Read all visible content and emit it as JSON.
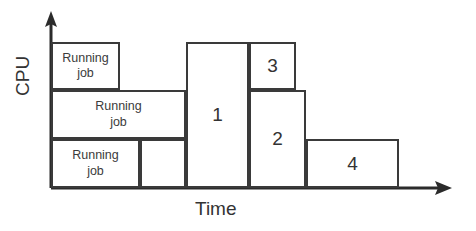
{
  "diagram": {
    "axes": {
      "y_label": "CPU",
      "x_label": "Time",
      "y_arrow": "up-arrow",
      "x_arrow": "right-arrow",
      "line_color": "#2b2b2b"
    },
    "style": {
      "block_border_color": "#3a3a3a",
      "block_fill": "#ffffff",
      "background": "#ffffff",
      "text_color": "#333333"
    },
    "blocks": [
      {
        "id": "running-job-top",
        "label": "Running\njob",
        "row": "top",
        "x": 51,
        "y": 42,
        "w": 69,
        "h": 48
      },
      {
        "id": "running-job-middle",
        "label": "Running\njob",
        "row": "middle",
        "x": 51,
        "y": 90,
        "w": 135,
        "h": 49
      },
      {
        "id": "running-job-bottom",
        "label": "Running\njob",
        "row": "bottom",
        "x": 51,
        "y": 139,
        "w": 89,
        "h": 49
      },
      {
        "id": "empty-slot",
        "label": "",
        "row": "bottom",
        "x": 140,
        "y": 139,
        "w": 46,
        "h": 49
      },
      {
        "id": "job-1",
        "label": "1",
        "row": "full",
        "x": 186,
        "y": 42,
        "w": 63,
        "h": 146
      },
      {
        "id": "job-3",
        "label": "3",
        "row": "top",
        "x": 249,
        "y": 42,
        "w": 47,
        "h": 48
      },
      {
        "id": "job-2",
        "label": "2",
        "row": "middle-bottom",
        "x": 249,
        "y": 90,
        "w": 57,
        "h": 98
      },
      {
        "id": "job-4",
        "label": "4",
        "row": "bottom",
        "x": 306,
        "y": 139,
        "w": 93,
        "h": 49
      }
    ]
  }
}
